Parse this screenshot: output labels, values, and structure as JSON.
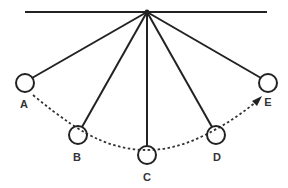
{
  "diagram": {
    "colors": {
      "stroke": "#222222",
      "label": "#333333",
      "background": "#ffffff"
    },
    "support_bar": {
      "x1": 25,
      "x2": 267,
      "y": 12
    },
    "pivot": {
      "x": 147,
      "y": 12
    },
    "bob_radius": 9,
    "bobs": [
      {
        "label": "A",
        "cx": 25,
        "cy": 83,
        "lx": 24,
        "ly": 108
      },
      {
        "label": "B",
        "cx": 78,
        "cy": 135,
        "lx": 77,
        "ly": 161
      },
      {
        "label": "C",
        "cx": 147,
        "cy": 155,
        "lx": 147,
        "ly": 181
      },
      {
        "label": "D",
        "cx": 216,
        "cy": 135,
        "lx": 217,
        "ly": 161
      },
      {
        "label": "E",
        "cx": 268,
        "cy": 83,
        "lx": 267,
        "ly": 106
      }
    ],
    "path": {
      "style": "dotted",
      "direction": "A to E",
      "arrowhead": "E"
    }
  }
}
